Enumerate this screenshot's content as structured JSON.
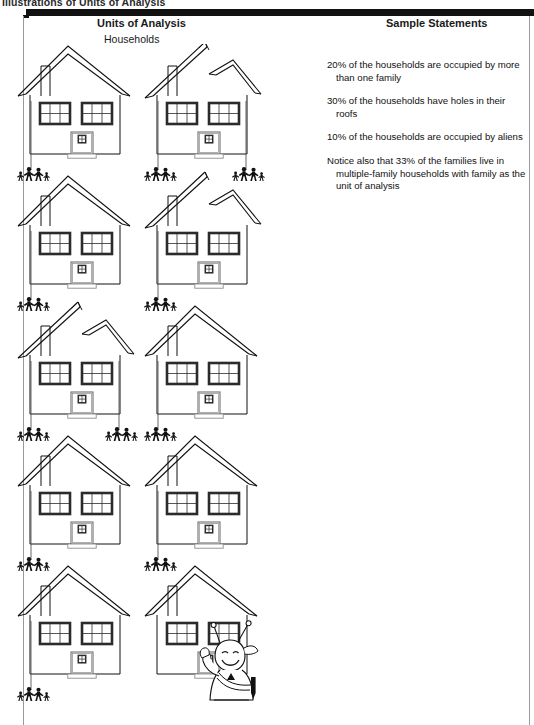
{
  "page": {
    "caption": "Illustrations of Units of Analysis"
  },
  "headers": {
    "units_of_analysis": "Units of Analysis",
    "units_subtitle": "Households",
    "sample_statements": "Sample Statements"
  },
  "statements": [
    "20% of the households are occupied by more than one family",
    "30% of the households have holes in their roofs",
    "10% of the households are occupied by aliens",
    "Notice also that 33% of the families live in multiple-family households with family as the unit of analysis"
  ],
  "figure": {
    "household_rows": 5,
    "households_per_row": 2,
    "total_households": 10,
    "households": [
      {
        "row": 1,
        "col": 1,
        "roof": "intact",
        "occupants": "family",
        "family_groups": 1
      },
      {
        "row": 1,
        "col": 2,
        "roof": "broken",
        "occupants": "family",
        "family_groups": 2
      },
      {
        "row": 2,
        "col": 1,
        "roof": "intact",
        "occupants": "family",
        "family_groups": 1
      },
      {
        "row": 2,
        "col": 2,
        "roof": "broken",
        "occupants": "family",
        "family_groups": 1
      },
      {
        "row": 3,
        "col": 1,
        "roof": "broken",
        "occupants": "family",
        "family_groups": 2
      },
      {
        "row": 3,
        "col": 2,
        "roof": "intact",
        "occupants": "family",
        "family_groups": 1
      },
      {
        "row": 4,
        "col": 1,
        "roof": "intact",
        "occupants": "family",
        "family_groups": 1
      },
      {
        "row": 4,
        "col": 2,
        "roof": "intact",
        "occupants": "family",
        "family_groups": 1
      },
      {
        "row": 5,
        "col": 1,
        "roof": "intact",
        "occupants": "family",
        "family_groups": 1
      },
      {
        "row": 5,
        "col": 2,
        "roof": "intact",
        "occupants": "alien",
        "family_groups": 0
      }
    ]
  },
  "colors": {
    "ink": "#111111",
    "frame_rule": "#9a9a9a",
    "window_frame": "#2b2b2b",
    "paper": "#ffffff"
  },
  "icons": {
    "house": "house-icon",
    "family": "family-group-icon",
    "alien": "alien-icon",
    "broken_roof": "broken-roof-icon"
  }
}
